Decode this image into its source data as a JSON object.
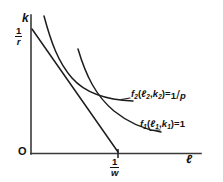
{
  "figure": {
    "type": "diagram",
    "background_color": "#ffffff",
    "ink_color": "#1d1d1d"
  },
  "axes": {
    "y": {
      "label": "k",
      "tick_numerator": "1",
      "tick_denominator": "r",
      "tick_value_text": "1/r"
    },
    "x": {
      "label": "ℓ",
      "tick_numerator": "1",
      "tick_denominator": "w",
      "tick_value_text": "1/w"
    },
    "origin_label": "O"
  },
  "curves": [
    {
      "name": "isocost-line",
      "shape": "straight",
      "from": "(0, 1/r)",
      "to": "(1/w, 0)"
    },
    {
      "name": "isoquant-f2",
      "shape": "convex",
      "label": {
        "function": "f",
        "subscript": "2",
        "arg1": "ℓ",
        "arg1_sub": "2",
        "arg2": "k",
        "arg2_sub": "2",
        "equals": "=",
        "value_numerator": "1",
        "value_denominator": "p",
        "full_text": "f2(ℓ2,k2)=1/p"
      }
    },
    {
      "name": "isoquant-f1",
      "shape": "convex",
      "label": {
        "function": "f",
        "subscript": "1",
        "arg1": "ℓ",
        "arg1_sub": "1",
        "arg2": "k",
        "arg2_sub": "1",
        "equals": "=",
        "value": "1",
        "full_text": "f1(ℓ1,k1)=1"
      }
    }
  ]
}
